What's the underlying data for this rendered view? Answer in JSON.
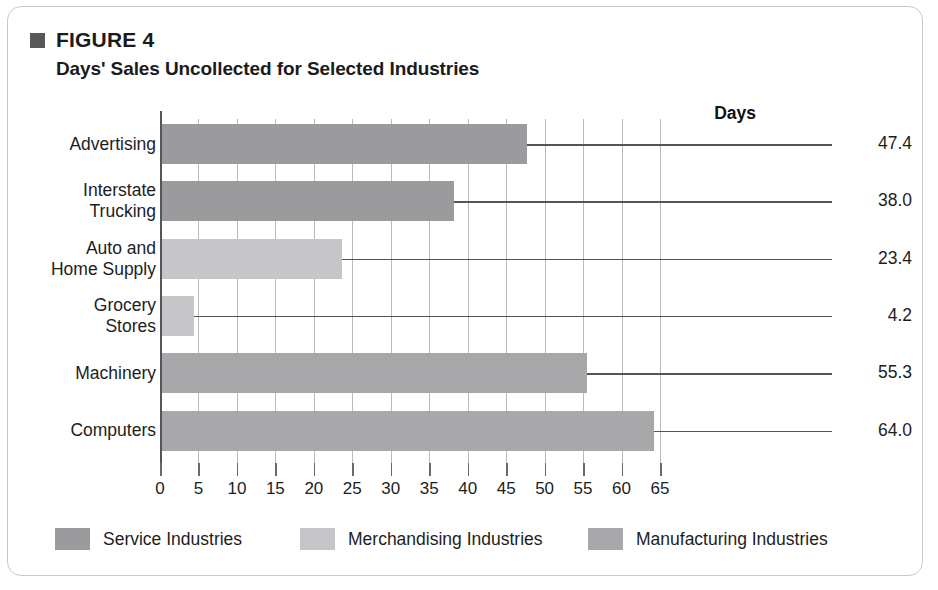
{
  "figure": {
    "label": "FIGURE 4",
    "title": "Days' Sales Uncollected for Selected Industries",
    "bullet_icon": "square-bullet-icon"
  },
  "chart_data": {
    "type": "bar",
    "orientation": "horizontal",
    "title": "Days' Sales Uncollected for Selected Industries",
    "xlabel": "",
    "ylabel": "",
    "value_axis_header": "Days",
    "categories": [
      "Advertising",
      "Interstate Trucking",
      "Auto and Home Supply",
      "Grocery Stores",
      "Machinery",
      "Computers"
    ],
    "category_lines": [
      [
        "Advertising"
      ],
      [
        "Interstate",
        "Trucking"
      ],
      [
        "Auto and",
        "Home Supply"
      ],
      [
        "Grocery",
        "Stores"
      ],
      [
        "Machinery"
      ],
      [
        "Computers"
      ]
    ],
    "values": [
      47.4,
      38.0,
      23.4,
      4.2,
      55.3,
      64.0
    ],
    "value_labels": [
      "47.4",
      "38.0",
      "23.4",
      "4.2",
      "55.3",
      "64.0"
    ],
    "groups": [
      "Service Industries",
      "Service Industries",
      "Merchandising Industries",
      "Merchandising Industries",
      "Manufacturing Industries",
      "Manufacturing Industries"
    ],
    "xlim": [
      0,
      65
    ],
    "xticks": [
      0,
      5,
      10,
      15,
      20,
      25,
      30,
      35,
      40,
      45,
      50,
      55,
      60,
      65
    ],
    "xtick_labels": [
      "0",
      "5",
      "10",
      "15",
      "20",
      "25",
      "30",
      "35",
      "40",
      "45",
      "50",
      "55",
      "60",
      "65"
    ],
    "grid": true,
    "legend_position": "bottom",
    "legend": [
      {
        "label": "Service Industries",
        "color": "#9b9b9e"
      },
      {
        "label": "Merchandising Industries",
        "color": "#c6c6c8"
      },
      {
        "label": "Manufacturing Industries",
        "color": "#a8a8ab"
      }
    ]
  },
  "colors": {
    "service": "#9b9b9e",
    "merchandising": "#c6c6c8",
    "manufacturing": "#a8a8ab",
    "axis": "#55555a",
    "grid": "#b9b9bd",
    "text": "#1d1d1d",
    "border": "#c9c9c9",
    "bullet": "#58585a"
  }
}
